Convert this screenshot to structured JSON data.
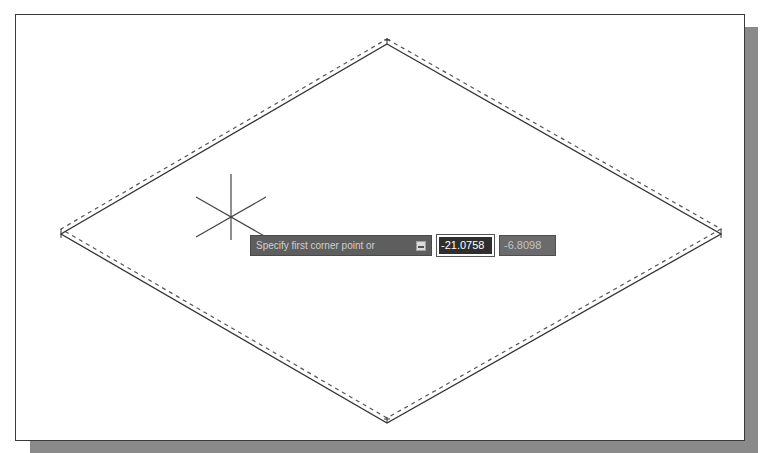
{
  "drawing": {
    "shape": "isometric-rectangle",
    "vertices": {
      "top": [
        387,
        44
      ],
      "right": [
        721,
        234
      ],
      "bottom": [
        387,
        423
      ],
      "left": [
        61,
        234
      ]
    },
    "line_color": "#333333",
    "dashed_offset_y": -5
  },
  "cursor": {
    "type": "isometric-crosshair",
    "center": [
      231,
      217
    ]
  },
  "dynamic_input": {
    "prompt": "Specify first corner point or",
    "options_icon": "down-arrow-icon",
    "x_value": "-21.0758",
    "y_value": "-6.8098"
  },
  "colors": {
    "prompt_bg": "#5e5e5e",
    "active_input_bg": "#2e2e2e",
    "inactive_input_bg": "#6b6b6b",
    "shadow": "#8a8a8a"
  }
}
